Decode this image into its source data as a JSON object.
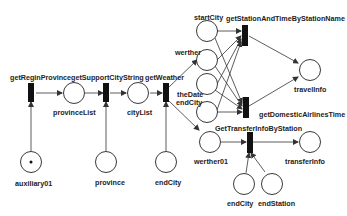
{
  "diagram": {
    "type": "petri-net",
    "transitions": [
      {
        "id": "t1",
        "label": "getReginProvince"
      },
      {
        "id": "t2",
        "label": "getSupportCityString"
      },
      {
        "id": "t3",
        "label": "getWeather"
      },
      {
        "id": "t4",
        "label": "getStationAndTimeByStationName"
      },
      {
        "id": "t5",
        "label": "getDomesticAirlinesTime"
      },
      {
        "id": "t6",
        "label": "GetTransferInfoByStation"
      }
    ],
    "places": [
      {
        "id": "p_aux",
        "label": "auxiliary01",
        "tokens": 1
      },
      {
        "id": "p_provlist",
        "label": "provinceList"
      },
      {
        "id": "p_province",
        "label": "province"
      },
      {
        "id": "p_citylist",
        "label": "cityList"
      },
      {
        "id": "p_endcity1",
        "label": "endCity"
      },
      {
        "id": "p_startcity",
        "label": "startCity"
      },
      {
        "id": "p_werther",
        "label": "werther"
      },
      {
        "id": "p_thedate",
        "label": "theDate"
      },
      {
        "id": "p_endcity2",
        "label": "endCity"
      },
      {
        "id": "p_travelinfo",
        "label": "travelInfo"
      },
      {
        "id": "p_werther01",
        "label": "werther01"
      },
      {
        "id": "p_transferinfo",
        "label": "transferInfo"
      },
      {
        "id": "p_endcity3",
        "label": "endCity"
      },
      {
        "id": "p_endstation",
        "label": "endStation"
      }
    ]
  }
}
